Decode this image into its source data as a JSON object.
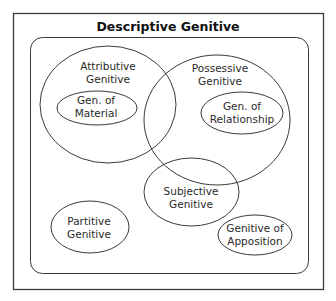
{
  "diagram": {
    "title": "Descriptive Genitive",
    "sets": {
      "attributive": {
        "line1": "Attributive",
        "line2": "Genitive"
      },
      "material": {
        "line1": "Gen. of",
        "line2": "Material"
      },
      "possessive": {
        "line1": "Possessive",
        "line2": "Genitive"
      },
      "relationship": {
        "line1": "Gen. of",
        "line2": "Relationship"
      },
      "subjective": {
        "line1": "Subjective",
        "line2": "Genitive"
      },
      "partitive": {
        "line1": "Partitive",
        "line2": "Genitive"
      },
      "apposition": {
        "line1": "Genitive of",
        "line2": "Apposition"
      }
    },
    "colors": {
      "stroke": "#3a3a3a",
      "background": "#ffffff",
      "text": "#2a2a2a"
    }
  }
}
